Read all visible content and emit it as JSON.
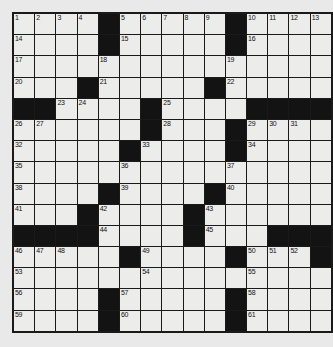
{
  "puzzle": {
    "type": "crossword-grid",
    "title": "Crossword Puzzle Grid",
    "rows": 15,
    "columns": 15,
    "colors": {
      "page_background": "#e9e9e9",
      "cell_fill": "#ececeb",
      "block_fill": "#131313",
      "grid_line": "#1a1a1a",
      "number_color": "#111111"
    },
    "highest_clue_number": 61,
    "legend": {
      "white_cell": "letter square",
      "black_cell": "blocked square"
    },
    "grid": [
      "WWWWBWWWWWBWWWW",
      "WWWWBWWWWWBWWWW",
      "WWWWWWWWWWWWWWW",
      "WWWBWWWWWBWWWWW",
      "BBWWWWBWWWWBBBB",
      "WWWWWWBWWWBWWWW",
      "WWWWWBWWWWBWWWW",
      "WWWWWWWWWWWWWWW",
      "WWWWBWWWWBWWWWW",
      "WWWBWWWWBWWWWWW",
      "BBBBWWWWBWWWBBB",
      "WWWWWBWWWWBWWWB",
      "WWWWWWWWWWWWWWW",
      "WWWWBWWWWWBWWWW",
      "WWWWBWWWWWBWWWW"
    ],
    "numbers": [
      {
        "n": 1,
        "row": 0,
        "col": 0
      },
      {
        "n": 2,
        "row": 0,
        "col": 1
      },
      {
        "n": 3,
        "row": 0,
        "col": 2
      },
      {
        "n": 4,
        "row": 0,
        "col": 3
      },
      {
        "n": 5,
        "row": 0,
        "col": 5
      },
      {
        "n": 6,
        "row": 0,
        "col": 6
      },
      {
        "n": 7,
        "row": 0,
        "col": 7
      },
      {
        "n": 8,
        "row": 0,
        "col": 8
      },
      {
        "n": 9,
        "row": 0,
        "col": 9
      },
      {
        "n": 10,
        "row": 0,
        "col": 11
      },
      {
        "n": 11,
        "row": 0,
        "col": 12
      },
      {
        "n": 12,
        "row": 0,
        "col": 13
      },
      {
        "n": 13,
        "row": 0,
        "col": 14
      },
      {
        "n": 14,
        "row": 1,
        "col": 0
      },
      {
        "n": 15,
        "row": 1,
        "col": 5
      },
      {
        "n": 16,
        "row": 1,
        "col": 11
      },
      {
        "n": 17,
        "row": 2,
        "col": 0
      },
      {
        "n": 18,
        "row": 2,
        "col": 4
      },
      {
        "n": 19,
        "row": 2,
        "col": 10
      },
      {
        "n": 20,
        "row": 3,
        "col": 0
      },
      {
        "n": 21,
        "row": 3,
        "col": 4
      },
      {
        "n": 22,
        "row": 3,
        "col": 10
      },
      {
        "n": 23,
        "row": 4,
        "col": 2
      },
      {
        "n": 24,
        "row": 4,
        "col": 3
      },
      {
        "n": 25,
        "row": 4,
        "col": 7
      },
      {
        "n": 26,
        "row": 5,
        "col": 0
      },
      {
        "n": 27,
        "row": 5,
        "col": 1
      },
      {
        "n": 28,
        "row": 5,
        "col": 7
      },
      {
        "n": 29,
        "row": 5,
        "col": 11
      },
      {
        "n": 30,
        "row": 5,
        "col": 12
      },
      {
        "n": 31,
        "row": 5,
        "col": 13
      },
      {
        "n": 32,
        "row": 6,
        "col": 0
      },
      {
        "n": 33,
        "row": 6,
        "col": 6
      },
      {
        "n": 34,
        "row": 6,
        "col": 11
      },
      {
        "n": 35,
        "row": 7,
        "col": 0
      },
      {
        "n": 36,
        "row": 7,
        "col": 5
      },
      {
        "n": 37,
        "row": 7,
        "col": 10
      },
      {
        "n": 38,
        "row": 8,
        "col": 0
      },
      {
        "n": 39,
        "row": 8,
        "col": 5
      },
      {
        "n": 40,
        "row": 8,
        "col": 10
      },
      {
        "n": 41,
        "row": 9,
        "col": 0
      },
      {
        "n": 42,
        "row": 9,
        "col": 4
      },
      {
        "n": 43,
        "row": 9,
        "col": 9
      },
      {
        "n": 44,
        "row": 10,
        "col": 4
      },
      {
        "n": 45,
        "row": 10,
        "col": 9
      },
      {
        "n": 46,
        "row": 11,
        "col": 0
      },
      {
        "n": 47,
        "row": 11,
        "col": 1
      },
      {
        "n": 48,
        "row": 11,
        "col": 2
      },
      {
        "n": 49,
        "row": 11,
        "col": 6
      },
      {
        "n": 50,
        "row": 11,
        "col": 11
      },
      {
        "n": 51,
        "row": 11,
        "col": 12
      },
      {
        "n": 52,
        "row": 11,
        "col": 13
      },
      {
        "n": 53,
        "row": 12,
        "col": 0
      },
      {
        "n": 54,
        "row": 12,
        "col": 6
      },
      {
        "n": 55,
        "row": 12,
        "col": 11
      },
      {
        "n": 56,
        "row": 13,
        "col": 0
      },
      {
        "n": 57,
        "row": 13,
        "col": 5
      },
      {
        "n": 58,
        "row": 13,
        "col": 11
      },
      {
        "n": 59,
        "row": 14,
        "col": 0
      },
      {
        "n": 60,
        "row": 14,
        "col": 5
      },
      {
        "n": 61,
        "row": 14,
        "col": 11
      }
    ]
  }
}
